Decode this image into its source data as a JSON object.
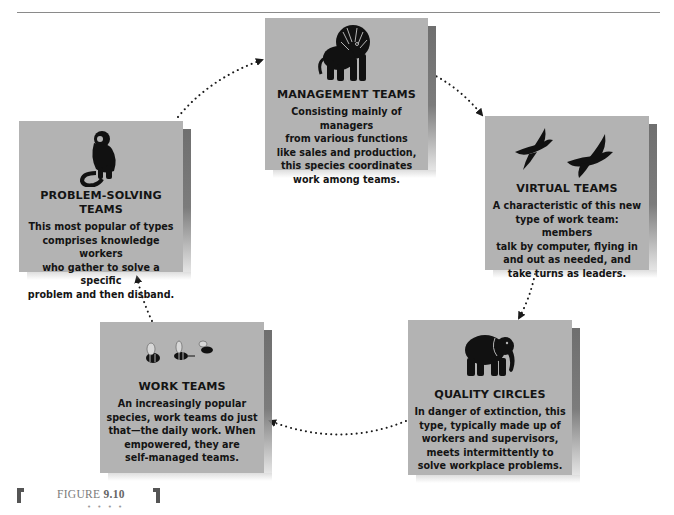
{
  "figure": {
    "label_prefix": "FIGURE",
    "label_number": "9.10",
    "ornament": "• • • •"
  },
  "colors": {
    "card_fill": "#b3b3b3",
    "card_shadow": "#6f6f6f",
    "text": "#141414",
    "arrow": "#1a1a1a"
  },
  "cycle_order": [
    "management",
    "virtual",
    "quality",
    "work",
    "problem_solving"
  ],
  "cards": {
    "management": {
      "icon": "lion-icon",
      "title": "MANAGEMENT TEAMS",
      "lines": [
        "Consisting mainly of managers",
        "from various functions",
        "like sales and production,",
        "this species coordinates",
        "work among teams."
      ]
    },
    "virtual": {
      "icon": "birds-icon",
      "title": "VIRTUAL TEAMS",
      "lines": [
        "A characteristic of this new",
        "type of work team: members",
        "talk by computer, flying in",
        "and out as needed, and",
        "take turns as leaders."
      ]
    },
    "quality": {
      "icon": "elephant-icon",
      "title": "QUALITY CIRCLES",
      "lines": [
        "In danger of extinction, this",
        "type, typically made up of",
        "workers and supervisors,",
        "meets intermittently to",
        "solve workplace problems."
      ]
    },
    "work": {
      "icon": "bees-icon",
      "title": "WORK TEAMS",
      "lines": [
        "An increasingly popular",
        "species, work teams do just",
        "that—the daily work. When",
        "empowered, they are",
        "self-managed teams."
      ]
    },
    "problem_solving": {
      "icon": "monkey-icon",
      "title": "PROBLEM-SOLVING TEAMS",
      "lines": [
        "This most popular of types",
        "comprises knowledge workers",
        "who gather to solve a specific",
        "problem and then disband."
      ]
    }
  }
}
